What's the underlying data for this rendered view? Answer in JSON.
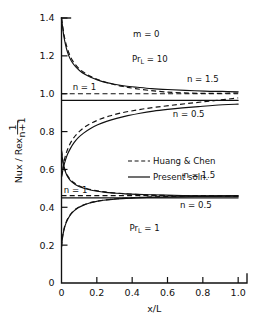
{
  "chart_data": {
    "type": "line",
    "title": "",
    "xlabel": "x/L",
    "ylabel": "Nux / Rex",
    "ylabel_exponent_numerator": "1",
    "ylabel_exponent_denominator": "n+1",
    "xlim": [
      0,
      1.05
    ],
    "ylim": [
      0,
      1.4
    ],
    "xticks": [
      "0",
      "0.2",
      "0.4",
      "0.6",
      "0.8",
      "1.0"
    ],
    "xtick_values": [
      0,
      0.2,
      0.4,
      0.6,
      0.8,
      1.0
    ],
    "yticks": [
      "0",
      "0.2",
      "0.4",
      "0.6",
      "0.8",
      "1.0",
      "1.2",
      "1.4"
    ],
    "ytick_values": [
      0,
      0.2,
      0.4,
      0.6,
      0.8,
      1.0,
      1.2,
      1.4
    ],
    "grid": false,
    "legend_position": "center-right",
    "legend": [
      {
        "label": "Huang & Chen",
        "style": "dashed"
      },
      {
        "label": "Present soln.",
        "style": "solid"
      }
    ],
    "annotations": [
      {
        "text": "m = 0",
        "x": 0.48,
        "y": 1.3
      },
      {
        "text": "Pr_L = 10",
        "base": "Pr",
        "subscript": "L",
        "tail": " = 10",
        "x": 0.5,
        "y": 1.17
      },
      {
        "text": "n = 1.5",
        "x": 0.8,
        "y": 1.06
      },
      {
        "text": "n = 1",
        "x": 0.13,
        "y": 1.02
      },
      {
        "text": "n = 0.5",
        "x": 0.72,
        "y": 0.875
      },
      {
        "text": "n = 1.5",
        "x": 0.78,
        "y": 0.555
      },
      {
        "text": "n = 1",
        "x": 0.08,
        "y": 0.478
      },
      {
        "text": "n = 0.5",
        "x": 0.76,
        "y": 0.395
      },
      {
        "text": "Pr_L = 1",
        "base": "Pr",
        "subscript": "L",
        "tail": " = 1",
        "x": 0.47,
        "y": 0.275
      }
    ],
    "series": [
      {
        "name": "PrL=10, n=1.5, Present soln.",
        "group": "Pr_L = 10",
        "n": 1.5,
        "style": "solid",
        "points": [
          [
            0.0,
            1.4
          ],
          [
            0.006,
            1.355
          ],
          [
            0.013,
            1.305
          ],
          [
            0.022,
            1.262
          ],
          [
            0.033,
            1.222
          ],
          [
            0.047,
            1.188
          ],
          [
            0.063,
            1.162
          ],
          [
            0.082,
            1.14
          ],
          [
            0.105,
            1.12
          ],
          [
            0.132,
            1.103
          ],
          [
            0.165,
            1.087
          ],
          [
            0.203,
            1.073
          ],
          [
            0.248,
            1.06
          ],
          [
            0.3,
            1.05
          ],
          [
            0.36,
            1.041
          ],
          [
            0.43,
            1.034
          ],
          [
            0.51,
            1.027
          ],
          [
            0.6,
            1.022
          ],
          [
            0.7,
            1.018
          ],
          [
            0.81,
            1.014
          ],
          [
            0.91,
            1.012
          ],
          [
            1.0,
            1.01
          ]
        ]
      },
      {
        "name": "PrL=10, n=1.5, Huang & Chen",
        "group": "Pr_L = 10",
        "n": 1.5,
        "style": "dashed",
        "points": [
          [
            0.0,
            1.4
          ],
          [
            0.008,
            1.348
          ],
          [
            0.017,
            1.298
          ],
          [
            0.028,
            1.255
          ],
          [
            0.042,
            1.215
          ],
          [
            0.058,
            1.182
          ],
          [
            0.078,
            1.155
          ],
          [
            0.1,
            1.132
          ],
          [
            0.128,
            1.112
          ],
          [
            0.16,
            1.094
          ],
          [
            0.198,
            1.078
          ],
          [
            0.242,
            1.063
          ],
          [
            0.292,
            1.05
          ],
          [
            0.35,
            1.038
          ],
          [
            0.418,
            1.027
          ],
          [
            0.495,
            1.018
          ],
          [
            0.58,
            1.01
          ],
          [
            0.675,
            1.005
          ],
          [
            0.78,
            1.002
          ],
          [
            0.89,
            1.002
          ],
          [
            1.0,
            1.004
          ]
        ]
      },
      {
        "name": "PrL=10, n=1, Present soln.",
        "group": "Pr_L = 10",
        "n": 1,
        "style": "solid",
        "points": [
          [
            0.0,
            0.965
          ],
          [
            1.0,
            0.965
          ]
        ]
      },
      {
        "name": "PrL=10, n=1, Huang & Chen",
        "group": "Pr_L = 10",
        "n": 1,
        "style": "dashed",
        "points": [
          [
            0.0,
            1.0
          ],
          [
            1.0,
            1.0
          ]
        ]
      },
      {
        "name": "PrL=10, n=0.5, Present soln.",
        "group": "Pr_L = 10",
        "n": 0.5,
        "style": "solid",
        "points": [
          [
            0.0,
            0.56
          ],
          [
            0.006,
            0.588
          ],
          [
            0.013,
            0.618
          ],
          [
            0.022,
            0.648
          ],
          [
            0.034,
            0.68
          ],
          [
            0.05,
            0.71
          ],
          [
            0.07,
            0.74
          ],
          [
            0.095,
            0.768
          ],
          [
            0.125,
            0.792
          ],
          [
            0.162,
            0.815
          ],
          [
            0.205,
            0.836
          ],
          [
            0.255,
            0.854
          ],
          [
            0.312,
            0.87
          ],
          [
            0.375,
            0.884
          ],
          [
            0.445,
            0.897
          ],
          [
            0.52,
            0.908
          ],
          [
            0.6,
            0.917
          ],
          [
            0.685,
            0.925
          ],
          [
            0.775,
            0.932
          ],
          [
            0.87,
            0.939
          ],
          [
            1.0,
            0.945
          ]
        ]
      },
      {
        "name": "PrL=10, n=0.5, Huang & Chen",
        "group": "Pr_L = 10",
        "n": 0.5,
        "style": "dashed",
        "points": [
          [
            0.0,
            0.56
          ],
          [
            0.006,
            0.6
          ],
          [
            0.014,
            0.64
          ],
          [
            0.024,
            0.678
          ],
          [
            0.038,
            0.714
          ],
          [
            0.056,
            0.748
          ],
          [
            0.078,
            0.778
          ],
          [
            0.105,
            0.804
          ],
          [
            0.138,
            0.828
          ],
          [
            0.176,
            0.848
          ],
          [
            0.22,
            0.866
          ],
          [
            0.27,
            0.882
          ],
          [
            0.326,
            0.896
          ],
          [
            0.39,
            0.908
          ],
          [
            0.46,
            0.919
          ],
          [
            0.535,
            0.929
          ],
          [
            0.615,
            0.938
          ],
          [
            0.7,
            0.947
          ],
          [
            0.79,
            0.956
          ],
          [
            0.89,
            0.966
          ],
          [
            1.0,
            0.978
          ]
        ]
      },
      {
        "name": "PrL=1, n=1.5, Present soln.",
        "group": "Pr_L = 1",
        "n": 1.5,
        "style": "solid",
        "points": [
          [
            0.0,
            0.7
          ],
          [
            0.005,
            0.66
          ],
          [
            0.011,
            0.625
          ],
          [
            0.019,
            0.596
          ],
          [
            0.029,
            0.572
          ],
          [
            0.042,
            0.551
          ],
          [
            0.058,
            0.534
          ],
          [
            0.078,
            0.52
          ],
          [
            0.102,
            0.508
          ],
          [
            0.13,
            0.499
          ],
          [
            0.164,
            0.491
          ],
          [
            0.203,
            0.485
          ],
          [
            0.248,
            0.479
          ],
          [
            0.3,
            0.475
          ],
          [
            0.36,
            0.471
          ],
          [
            0.428,
            0.468
          ],
          [
            0.505,
            0.466
          ],
          [
            0.59,
            0.464
          ],
          [
            0.685,
            0.462
          ],
          [
            0.79,
            0.461
          ],
          [
            0.9,
            0.46
          ],
          [
            1.0,
            0.46
          ]
        ]
      },
      {
        "name": "PrL=1, n=1.5, Huang & Chen",
        "group": "Pr_L = 1",
        "n": 1.5,
        "style": "dashed",
        "points": [
          [
            0.0,
            0.7
          ],
          [
            0.006,
            0.656
          ],
          [
            0.013,
            0.62
          ],
          [
            0.022,
            0.592
          ],
          [
            0.034,
            0.568
          ],
          [
            0.049,
            0.548
          ],
          [
            0.067,
            0.532
          ],
          [
            0.089,
            0.518
          ],
          [
            0.115,
            0.507
          ],
          [
            0.146,
            0.498
          ],
          [
            0.182,
            0.49
          ],
          [
            0.223,
            0.484
          ],
          [
            0.27,
            0.478
          ],
          [
            0.323,
            0.474
          ],
          [
            0.383,
            0.47
          ],
          [
            0.45,
            0.467
          ],
          [
            0.525,
            0.464
          ],
          [
            0.608,
            0.462
          ],
          [
            0.7,
            0.46
          ],
          [
            0.8,
            0.459
          ],
          [
            0.9,
            0.458
          ],
          [
            1.0,
            0.458
          ]
        ]
      },
      {
        "name": "PrL=1, n=1, Present soln.",
        "group": "Pr_L = 1",
        "n": 1,
        "style": "solid",
        "points": [
          [
            0.0,
            0.45
          ],
          [
            1.0,
            0.45
          ]
        ]
      },
      {
        "name": "PrL=1, n=1, Huang & Chen",
        "group": "Pr_L = 1",
        "n": 1,
        "style": "dashed",
        "points": [
          [
            0.0,
            0.462
          ],
          [
            1.0,
            0.462
          ]
        ]
      },
      {
        "name": "PrL=1, n=0.5, Present soln.",
        "group": "Pr_L = 1",
        "n": 0.5,
        "style": "solid",
        "points": [
          [
            0.0,
            0.19
          ],
          [
            0.004,
            0.225
          ],
          [
            0.009,
            0.258
          ],
          [
            0.016,
            0.288
          ],
          [
            0.025,
            0.315
          ],
          [
            0.037,
            0.34
          ],
          [
            0.052,
            0.362
          ],
          [
            0.071,
            0.381
          ],
          [
            0.094,
            0.397
          ],
          [
            0.122,
            0.41
          ],
          [
            0.155,
            0.421
          ],
          [
            0.193,
            0.43
          ],
          [
            0.237,
            0.437
          ],
          [
            0.288,
            0.442
          ],
          [
            0.345,
            0.446
          ],
          [
            0.41,
            0.449
          ],
          [
            0.483,
            0.452
          ],
          [
            0.565,
            0.454
          ],
          [
            0.655,
            0.455
          ],
          [
            0.755,
            0.457
          ],
          [
            0.87,
            0.458
          ],
          [
            1.0,
            0.459
          ]
        ]
      },
      {
        "name": "PrL=1, n=0.5, Huang & Chen",
        "group": "Pr_L = 1",
        "n": 0.5,
        "style": "dashed",
        "points": [
          [
            0.0,
            0.19
          ],
          [
            0.004,
            0.232
          ],
          [
            0.01,
            0.268
          ],
          [
            0.018,
            0.3
          ],
          [
            0.029,
            0.328
          ],
          [
            0.043,
            0.352
          ],
          [
            0.06,
            0.373
          ],
          [
            0.081,
            0.391
          ],
          [
            0.107,
            0.405
          ],
          [
            0.138,
            0.417
          ],
          [
            0.174,
            0.427
          ],
          [
            0.215,
            0.434
          ],
          [
            0.262,
            0.44
          ],
          [
            0.315,
            0.445
          ],
          [
            0.375,
            0.449
          ],
          [
            0.442,
            0.452
          ],
          [
            0.515,
            0.455
          ],
          [
            0.596,
            0.457
          ],
          [
            0.685,
            0.458
          ],
          [
            0.782,
            0.459
          ],
          [
            0.888,
            0.46
          ],
          [
            1.0,
            0.461
          ]
        ]
      }
    ]
  }
}
